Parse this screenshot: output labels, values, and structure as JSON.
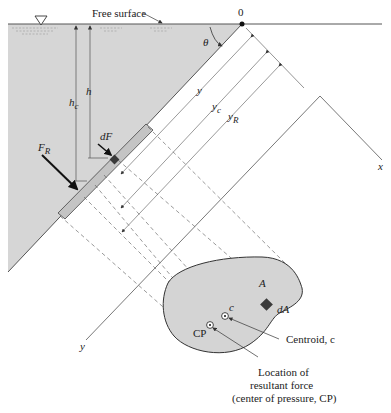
{
  "figure": {
    "type": "hydrostatic force on inclined submerged plane surface",
    "labels": {
      "free_surface": "Free surface",
      "origin": "0",
      "theta": "θ",
      "h": "h",
      "h_c_main": "h",
      "h_c_sub": "c",
      "dF": "dF",
      "F_R_main": "F",
      "F_R_sub": "R",
      "y": "y",
      "y_c_main": "y",
      "y_c_sub": "c",
      "y_R_main": "y",
      "y_R_sub": "R",
      "x_axis": "x",
      "y_axis": "y",
      "area": "A",
      "dA": "dA",
      "centroid_point": "c",
      "cp_point": "CP",
      "centroid_callout": "Centroid, c",
      "cp_callout_line1": "Location of",
      "cp_callout_line2": "resultant force",
      "cp_callout_line3": "(center of pressure, CP)"
    },
    "colors": {
      "fluid": "#d4d4d4",
      "plate_strip": "#c6c6c6",
      "element": "#3a3a3a",
      "line": "#444444",
      "text": "#222222"
    }
  }
}
